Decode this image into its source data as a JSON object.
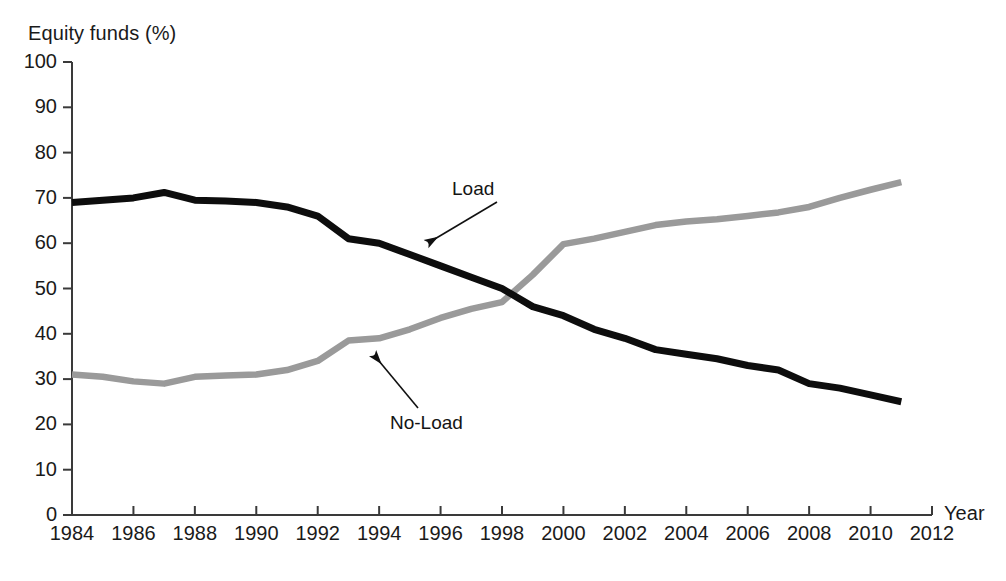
{
  "chart_data": {
    "type": "line",
    "title": "",
    "ylabel": "Equity funds (%)",
    "xlabel": "Year",
    "xlim": [
      1984,
      2012
    ],
    "ylim": [
      0,
      100
    ],
    "grid": false,
    "legend_position": "inline-annotations",
    "y_ticks": [
      0,
      10,
      20,
      30,
      40,
      50,
      60,
      70,
      80,
      90,
      100
    ],
    "y_tick_labels": [
      "0",
      "10",
      "20",
      "30",
      "40",
      "50",
      "60",
      "70",
      "80",
      "90",
      "100"
    ],
    "x_ticks": [
      1984,
      1986,
      1988,
      1990,
      1992,
      1994,
      1996,
      1998,
      2000,
      2002,
      2004,
      2006,
      2008,
      2010,
      2012
    ],
    "x_tick_labels": [
      "1984",
      "1986",
      "1988",
      "1990",
      "1992",
      "1994",
      "1996",
      "1998",
      "2000",
      "2002",
      "2004",
      "2006",
      "2008",
      "2010",
      "2012"
    ],
    "x": [
      1984,
      1985,
      1986,
      1987,
      1988,
      1989,
      1990,
      1991,
      1992,
      1993,
      1994,
      1995,
      1996,
      1997,
      1998,
      1999,
      2000,
      2001,
      2002,
      2003,
      2004,
      2005,
      2006,
      2007,
      2008,
      2009,
      2010,
      2011
    ],
    "series": [
      {
        "name": "Load",
        "color": "#0d0d0d",
        "values": [
          69.0,
          69.5,
          70.0,
          71.2,
          69.5,
          69.3,
          69.0,
          68.0,
          66.0,
          61.0,
          60.0,
          57.5,
          55.0,
          52.5,
          50.0,
          46.0,
          44.0,
          41.0,
          39.0,
          36.5,
          35.5,
          34.5,
          33.0,
          32.0,
          29.0,
          28.0,
          26.5,
          25.0
        ]
      },
      {
        "name": "No-Load",
        "color": "#9a9a9a",
        "values": [
          31.0,
          30.5,
          29.5,
          29.0,
          30.5,
          30.8,
          31.0,
          32.0,
          34.0,
          38.5,
          39.0,
          41.0,
          43.5,
          45.5,
          47.0,
          53.0,
          59.8,
          61.0,
          62.5,
          64.0,
          64.8,
          65.3,
          66.0,
          66.8,
          68.0,
          70.0,
          71.8,
          73.5
        ]
      }
    ],
    "annotations": [
      {
        "name": "Load",
        "text": "Load",
        "target_year": 1995.7,
        "target_value": 56.0
      },
      {
        "name": "No-Load",
        "text": "No-Load",
        "target_year": 1993.3,
        "target_value": 37.0
      }
    ]
  },
  "axes": {
    "y_title": "Equity funds (%)",
    "x_title": "Year"
  },
  "labels": {
    "load": "Load",
    "no_load": "No-Load"
  }
}
